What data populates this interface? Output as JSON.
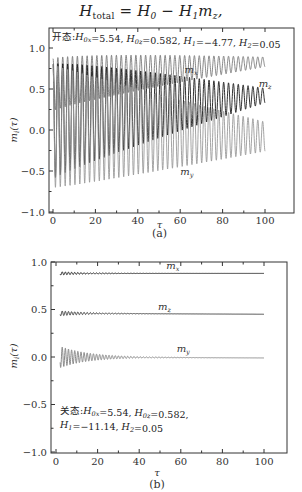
{
  "equation": {
    "H": "H",
    "total_sub": "total",
    "eq_rest": " = H",
    "h0_sub": "0",
    "minus": " − H",
    "h1_sub": "1",
    "m": "m",
    "mz_sub": "z",
    "comma": ","
  },
  "chart_data": [
    {
      "id": "a",
      "type": "line",
      "caption": "(a)",
      "annotation": "开态:H0x=5.54, H0z=0.582, H1=−4.77, H2=0.05",
      "annotation_parts": [
        "开态:",
        "H",
        "0x",
        "=5.54, ",
        "H",
        "0z",
        "=0.582, ",
        "H",
        "1",
        "=−4.77, ",
        "H",
        "2",
        "=0.05"
      ],
      "xlabel": "τ",
      "ylabel": "m_i(τ)",
      "xlim": [
        0,
        100
      ],
      "ylim": [
        -1.0,
        1.2
      ],
      "xticks": [
        0,
        20,
        40,
        60,
        80,
        100
      ],
      "xtick_labels": [
        "0",
        "20",
        "40",
        "60",
        "80",
        "100"
      ],
      "yticks": [
        -1.0,
        -0.5,
        0.0,
        0.5,
        1.0
      ],
      "ytick_labels": [
        "−1.0",
        "−0.5",
        "0.0",
        "0.5",
        "1.0"
      ],
      "series": [
        {
          "name": "m_x",
          "label": "m",
          "sub": "x",
          "color": "#7a7a7a",
          "center_start": 0.55,
          "center_end": 0.83,
          "amp_start": 0.32,
          "amp_end": 0.06,
          "period": 2.3,
          "label_pos": [
            62,
            0.7
          ]
        },
        {
          "name": "m_z",
          "label": "m",
          "sub": "z",
          "color": "#1a1a1a",
          "center_start": 0.1,
          "center_end": 0.42,
          "amp_start": 0.7,
          "amp_end": 0.09,
          "period": 2.3,
          "label_pos": [
            97,
            0.53
          ]
        },
        {
          "name": "m_y",
          "label": "m",
          "sub": "y",
          "color": "#9a9a9a",
          "center_start": 0.05,
          "center_end": -0.08,
          "amp_start": 0.75,
          "amp_end": 0.18,
          "period": 2.3,
          "label_pos": [
            60,
            -0.55
          ]
        }
      ]
    },
    {
      "id": "b",
      "type": "line",
      "caption": "(b)",
      "annotation_line1_parts": [
        "关态:",
        "H",
        "0x",
        "=5.54, ",
        "H",
        "0z",
        "=0.582,"
      ],
      "annotation_line2_parts": [
        "H",
        "1",
        "=−11.14, ",
        "H",
        "2",
        "=0.05"
      ],
      "xlabel": "τ",
      "ylabel": "m_i(τ)",
      "xlim": [
        0,
        100
      ],
      "ylim": [
        -1.0,
        1.0
      ],
      "xticks": [
        0,
        20,
        40,
        60,
        80,
        100
      ],
      "xtick_labels": [
        "0",
        "20",
        "40",
        "60",
        "80",
        "100"
      ],
      "yticks": [
        -1.0,
        -0.5,
        0.0,
        0.5,
        1.0
      ],
      "ytick_labels": [
        "−1.0",
        "−0.5",
        "0.0",
        "0.5",
        "1.0"
      ],
      "series": [
        {
          "name": "m_x",
          "label": "m",
          "sub": "x",
          "color": "#1a1a1a",
          "center_start": 0.88,
          "center_end": 0.88,
          "amp_start": 0.02,
          "amp_end": 0.0,
          "period": 1.5,
          "label_pos": [
            53,
            0.93
          ]
        },
        {
          "name": "m_z",
          "label": "m",
          "sub": "z",
          "color": "#3a3a3a",
          "center_start": 0.46,
          "center_end": 0.45,
          "amp_start": 0.03,
          "amp_end": 0.0,
          "period": 1.5,
          "label_pos": [
            49,
            0.5
          ]
        },
        {
          "name": "m_y",
          "label": "m",
          "sub": "y",
          "color": "#8a8a8a",
          "center_start": 0.0,
          "center_end": -0.01,
          "amp_start": 0.13,
          "amp_end": 0.0,
          "period": 1.5,
          "label_pos": [
            58,
            0.05
          ]
        }
      ]
    }
  ]
}
